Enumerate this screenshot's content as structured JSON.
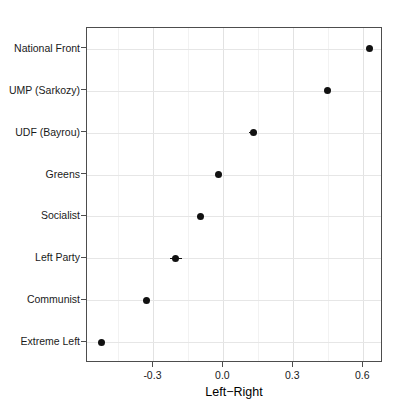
{
  "chart_data": {
    "type": "scatter",
    "title": "",
    "subtitle": "",
    "xlabel": "Left−Right",
    "ylabel": "",
    "orientation": "horizontal",
    "grid": true,
    "legend": null,
    "xlim": [
      -0.585,
      0.685
    ],
    "xticks": [
      -0.3,
      0.0,
      0.3,
      0.6
    ],
    "xtick_labels": [
      "-0.3",
      "0.0",
      "0.3",
      "0.6"
    ],
    "xminor_ticks": [
      -0.45,
      -0.15,
      0.15,
      0.45
    ],
    "categories": [
      "National Front",
      "UMP (Sarkozy)",
      "UDF (Bayrou)",
      "Greens",
      "Socialist",
      "Left Party",
      "Communist",
      "Extreme Left"
    ],
    "values": [
      0.625,
      0.446,
      0.129,
      -0.021,
      -0.099,
      -0.206,
      -0.33,
      -0.523
    ],
    "error_low": [
      0.625,
      0.446,
      0.112,
      -0.021,
      -0.099,
      -0.228,
      -0.33,
      -0.523
    ],
    "error_high": [
      0.625,
      0.446,
      0.146,
      -0.021,
      -0.099,
      -0.176,
      -0.33,
      -0.523
    ],
    "point_color": "#111111",
    "panel_background": "#ffffff",
    "grid_color": "#ebebeb",
    "axis_color": "#4d4d4d"
  },
  "axes": {
    "x_title": "Left−Right"
  }
}
